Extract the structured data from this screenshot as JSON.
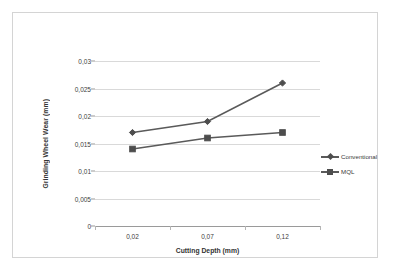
{
  "chart_data": {
    "type": "line",
    "title": "",
    "xlabel": "Cutting Depth (mm)",
    "ylabel": "Grinding Wheel Wear (mm)",
    "categories": [
      "0,02",
      "0,07",
      "0,12"
    ],
    "x_values": [
      0.02,
      0.07,
      0.12
    ],
    "ylim": [
      0,
      0.03
    ],
    "y_ticks": [
      0,
      0.005,
      0.01,
      0.015,
      0.02,
      0.025,
      0.03
    ],
    "y_tick_labels": [
      "0",
      "0,005",
      "0,01",
      "0,015",
      "0,02",
      "0,025",
      "0,03"
    ],
    "grid": true,
    "legend_position": "right",
    "series": [
      {
        "name": "Conventional",
        "marker": "diamond",
        "color": "#5a5a5a",
        "values": [
          0.017,
          0.019,
          0.026
        ]
      },
      {
        "name": "MQL",
        "marker": "square",
        "color": "#5a5a5a",
        "values": [
          0.014,
          0.016,
          0.017
        ]
      }
    ]
  },
  "legend": {
    "items": [
      {
        "label": "Conventional",
        "marker": "diamond-marker-icon"
      },
      {
        "label": "MQL",
        "marker": "square-marker-icon"
      }
    ]
  },
  "colors": {
    "series_line": "#5a5a5a",
    "gridline": "#d9d9d9",
    "axis": "#9a9a9a",
    "frame_border": "#d4d4d4",
    "text": "#3a3a3a",
    "background": "#ffffff"
  }
}
